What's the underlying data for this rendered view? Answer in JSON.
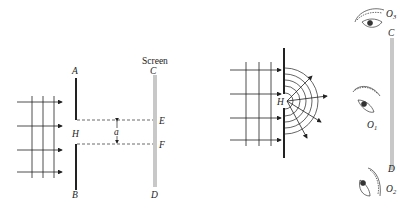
{
  "figure_left": {
    "title": "Single-slit diffraction setup with screen",
    "screen_label": "Screen",
    "labels": {
      "A": "A",
      "B": "B",
      "C": "C",
      "D": "D",
      "E": "E",
      "F": "F",
      "H": "H",
      "a": "a"
    },
    "colors": {
      "ink": "#222222",
      "screen": "#c8c8c8",
      "dashed": "#444444"
    }
  },
  "figure_right": {
    "title": "Diffraction from aperture with observers",
    "labels": {
      "H": "H",
      "C": "C",
      "D": "D",
      "O1": "O",
      "O1_sub": "1",
      "O2": "O",
      "O2_sub": "2",
      "O3": "O",
      "O3_sub": "3"
    },
    "colors": {
      "ink": "#222222",
      "screen": "#c8c8c8"
    }
  }
}
